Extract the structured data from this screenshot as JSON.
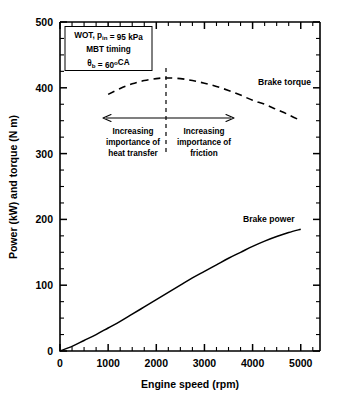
{
  "chart_data": {
    "type": "line",
    "title": "",
    "xlabel": "Engine speed (rpm)",
    "ylabel": "Power (kW) and torque (N m)",
    "xlim": [
      0,
      5400
    ],
    "ylim": [
      0,
      500
    ],
    "xticks": [
      0,
      1000,
      2000,
      3000,
      4000,
      5000
    ],
    "xticklabels": [
      "0",
      "1000",
      "2000",
      "3000",
      "4000",
      "5000"
    ],
    "yticks": [
      0,
      100,
      200,
      300,
      400,
      500
    ],
    "yticklabels": [
      "0",
      "100",
      "200",
      "300",
      "400",
      "500"
    ],
    "x_minor_step": 250,
    "y_minor_step": 25,
    "grid": false,
    "legend_position": "inline-labels",
    "series": [
      {
        "name": "Brake power",
        "style": "solid",
        "unit": "kW",
        "label": "Brake power",
        "x": [
          0,
          250,
          500,
          750,
          1000,
          1250,
          1500,
          1750,
          2000,
          2250,
          2500,
          2750,
          3000,
          3250,
          3500,
          3750,
          4000,
          4250,
          4500,
          4750,
          5000
        ],
        "values": [
          0,
          7,
          16,
          25,
          35,
          45,
          56,
          67,
          78,
          89,
          100,
          111,
          121,
          131,
          141,
          150,
          159,
          167,
          174,
          180,
          185
        ]
      },
      {
        "name": "Brake torque",
        "style": "dashed",
        "unit": "N m",
        "label": "Brake torque",
        "x": [
          1000,
          1250,
          1500,
          1750,
          2000,
          2200,
          2500,
          2750,
          3000,
          3250,
          3500,
          3750,
          4000,
          4250,
          4500,
          4750,
          5000
        ],
        "values": [
          390,
          399,
          406,
          411,
          414,
          415,
          414,
          411,
          407,
          402,
          396,
          389,
          381,
          375,
          367,
          359,
          350
        ]
      }
    ],
    "annotations": {
      "condition_box": {
        "lines": [
          {
            "segments": [
              {
                "t": "WOT, p",
                "k": "normal"
              },
              {
                "t": "in",
                "k": "sub"
              },
              {
                "t": " = 95 kPa",
                "k": "normal"
              }
            ]
          },
          {
            "segments": [
              {
                "t": "MBT timing",
                "k": "normal"
              }
            ]
          },
          {
            "segments": [
              {
                "t": "θ",
                "k": "normal"
              },
              {
                "t": "b",
                "k": "sub"
              },
              {
                "t": " = 60",
                "k": "normal"
              },
              {
                "t": "o",
                "k": "sup"
              },
              {
                "t": "CA",
                "k": "normal"
              }
            ]
          }
        ]
      },
      "divider_x_rpm": 2200,
      "arrow_left_label": "Increasing\nimportance of\nheat transfer",
      "arrow_left_lines": [
        "Increasing",
        "importance of",
        "heat transfer"
      ],
      "arrow_right_lines": [
        "Increasing",
        "importance of",
        "friction"
      ],
      "arrow_span_rpm": [
        900,
        3570
      ],
      "arrow_y_value": 358
    },
    "colors": {
      "axis": "#000000",
      "curve": "#000000",
      "background": "#ffffff"
    }
  }
}
